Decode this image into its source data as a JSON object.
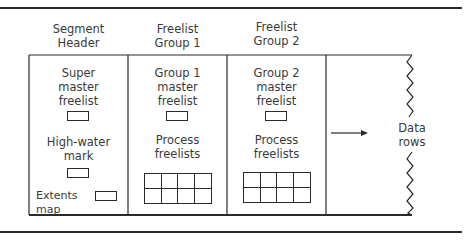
{
  "diagram": {
    "columns": [
      {
        "header": [
          "Segment",
          "Header"
        ],
        "items": [
          {
            "type": "label",
            "lines": [
              "Super",
              "master",
              "freelist"
            ]
          },
          {
            "type": "block"
          },
          {
            "type": "label",
            "lines": [
              "High-water",
              "mark"
            ]
          },
          {
            "type": "block"
          },
          {
            "type": "inline-block",
            "label": "Extents map"
          }
        ]
      },
      {
        "header": [
          "Freelist",
          "Group 1"
        ],
        "items": [
          {
            "type": "label",
            "lines": [
              "Group 1",
              "master",
              "freelist"
            ]
          },
          {
            "type": "block"
          },
          {
            "type": "label",
            "lines": [
              "Process",
              "freelists"
            ]
          },
          {
            "type": "grid",
            "rows": 2,
            "cols": 4
          }
        ]
      },
      {
        "header": [
          "Freelist",
          "Group 2"
        ],
        "items": [
          {
            "type": "label",
            "lines": [
              "Group 2",
              "master",
              "freelist"
            ]
          },
          {
            "type": "block"
          },
          {
            "type": "label",
            "lines": [
              "Process",
              "freelists"
            ]
          },
          {
            "type": "grid",
            "rows": 2,
            "cols": 4
          }
        ]
      }
    ],
    "data_region": {
      "arrow": "right-arrow",
      "label": [
        "Data",
        "rows"
      ]
    },
    "colors": {
      "line": "#2a2a2a",
      "text": "#3a3a3a",
      "background": "#ffffff"
    }
  },
  "text": {
    "col1_head_1": "Segment",
    "col1_head_2": "Header",
    "col2_head_1": "Freelist",
    "col2_head_2": "Group 1",
    "col3_head_1": "Freelist",
    "col3_head_2": "Group 2",
    "col1_a_1": "Super",
    "col1_a_2": "master",
    "col1_a_3": "freelist",
    "col1_b_1": "High-water",
    "col1_b_2": "mark",
    "col1_c": "Extents map",
    "col2_a_1": "Group 1",
    "col2_a_2": "master",
    "col2_a_3": "freelist",
    "col2_b_1": "Process",
    "col2_b_2": "freelists",
    "col3_a_1": "Group 2",
    "col3_a_2": "master",
    "col3_a_3": "freelist",
    "col3_b_1": "Process",
    "col3_b_2": "freelists",
    "data_1": "Data",
    "data_2": "rows"
  }
}
